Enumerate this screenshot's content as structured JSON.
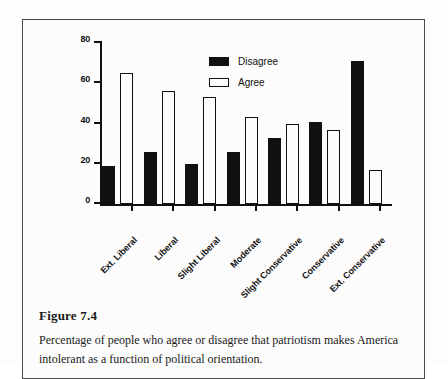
{
  "figure": {
    "caption_title": "Figure 7.4",
    "caption_body": "Percentage of people who agree or disagree that patriotism makes America intolerant as a function of political orientation."
  },
  "chart_data": {
    "type": "bar",
    "title": "",
    "xlabel": "",
    "ylabel": "",
    "ylim": [
      0,
      80
    ],
    "yticks": [
      0,
      20,
      40,
      60,
      80
    ],
    "grid": false,
    "legend_position": "top-center",
    "categories": [
      "Ext. Liberal",
      "Liberal",
      "Slight Liberal",
      "Moderate",
      "Slight Conservative",
      "Conservative",
      "Ext. Conservative"
    ],
    "series": [
      {
        "name": "Disagree",
        "color": "#111111",
        "fill": "solid",
        "values": [
          19,
          26,
          20,
          26,
          33,
          41,
          71
        ]
      },
      {
        "name": "Agree",
        "color": "#ffffff",
        "fill": "outline",
        "values": [
          65,
          56,
          53,
          43,
          40,
          37,
          17
        ]
      }
    ]
  }
}
